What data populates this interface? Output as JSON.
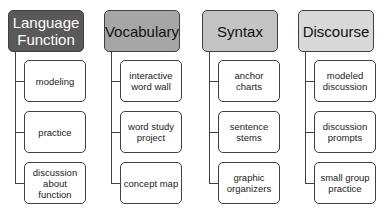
{
  "columns": [
    {
      "title": "Language Function",
      "fill": "#595959",
      "text_color": "#ffffff",
      "items": [
        "modeling",
        "practice",
        "discussion about function"
      ]
    },
    {
      "title": "Vocabulary",
      "fill": "#a6a6a6",
      "text_color": "#111111",
      "items": [
        "interactive word wall",
        "word study project",
        "concept map"
      ]
    },
    {
      "title": "Syntax",
      "fill": "#c4c4c4",
      "text_color": "#111111",
      "items": [
        "anchor charts",
        "sentence stems",
        "graphic organizers"
      ]
    },
    {
      "title": "Discourse",
      "fill": "#d9d9d9",
      "text_color": "#111111",
      "items": [
        "modeled discussion",
        "discussion prompts",
        "small group practice"
      ]
    }
  ]
}
